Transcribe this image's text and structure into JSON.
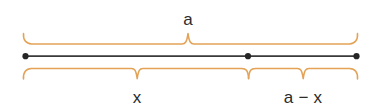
{
  "diagram": {
    "background_color": "#ffffff",
    "segment": {
      "color": "#3a3a3a",
      "point_color": "#262626",
      "y": 56,
      "start_x": 25,
      "division_x": 248,
      "end_x": 357,
      "points": [
        {
          "name": "left-endpoint",
          "x": 25,
          "y": 56
        },
        {
          "name": "division-point",
          "x": 248,
          "y": 56
        },
        {
          "name": "right-endpoint",
          "x": 357,
          "y": 56
        }
      ]
    },
    "brace_color": "#e3a256",
    "braces": [
      {
        "name": "total-length-brace",
        "orientation": "up",
        "start_x": 23,
        "end_x": 358,
        "peak_x": 188,
        "baseline_y": 44,
        "peak_y": 33,
        "label": "a"
      },
      {
        "name": "x-length-brace",
        "orientation": "down",
        "start_x": 23,
        "end_x": 248,
        "peak_x": 137,
        "baseline_y": 68,
        "peak_y": 79,
        "label": "x"
      },
      {
        "name": "a-minus-x-length-brace",
        "orientation": "down",
        "start_x": 248,
        "end_x": 358,
        "peak_x": 303,
        "baseline_y": 68,
        "peak_y": 79,
        "label": "a − x"
      }
    ],
    "labels": {
      "total": "a",
      "first_part": "x",
      "second_part": "a − x"
    }
  }
}
